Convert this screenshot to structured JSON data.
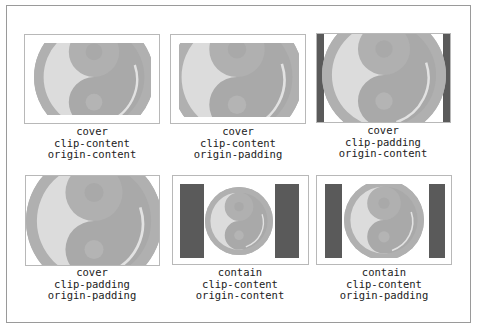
{
  "figure": {
    "panels": [
      {
        "label_lines": [
          "cover",
          "clip-content",
          "origin-content"
        ]
      },
      {
        "label_lines": [
          "cover",
          "clip-content",
          "origin-padding"
        ]
      },
      {
        "label_lines": [
          "cover",
          "clip-padding",
          "origin-content"
        ]
      },
      {
        "label_lines": [
          "cover",
          "clip-padding",
          "origin-padding"
        ]
      },
      {
        "label_lines": [
          "contain",
          "clip-content",
          "origin-content"
        ]
      },
      {
        "label_lines": [
          "contain",
          "clip-content",
          "origin-padding"
        ]
      }
    ],
    "colors": {
      "frame_border": "#9a9a9a",
      "box_border": "#b8b8b8",
      "bar": "#5a5a5a",
      "ring": "#b0b0b0",
      "yin": "#a9a9a9",
      "yang": "#dcdcdc"
    }
  }
}
